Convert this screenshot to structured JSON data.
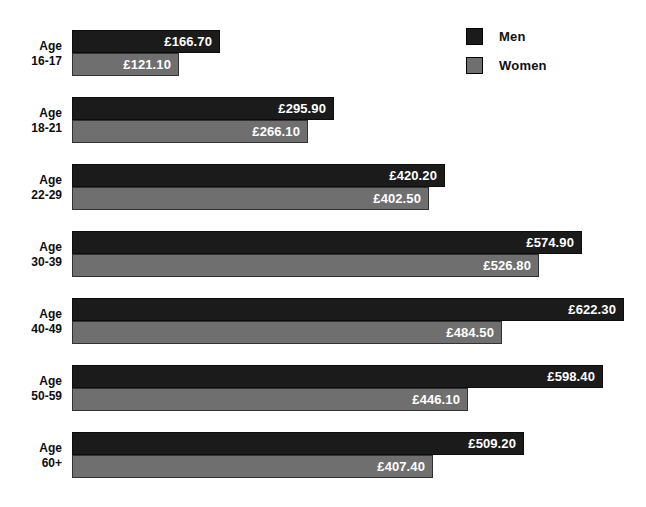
{
  "chart_data": {
    "type": "bar",
    "orientation": "horizontal",
    "title": "",
    "subtitle": "",
    "xlabel": "",
    "ylabel": "",
    "grid": false,
    "legend_position": "top-right",
    "value_prefix": "£",
    "categories": [
      "Age 16-17",
      "Age 18-21",
      "Age 22-29",
      "Age 30-39",
      "Age 40-49",
      "Age 50-59",
      "Age 60+"
    ],
    "category_lines": [
      [
        "Age",
        "16-17"
      ],
      [
        "Age",
        "18-21"
      ],
      [
        "Age",
        "22-29"
      ],
      [
        "Age",
        "30-39"
      ],
      [
        "Age",
        "40-49"
      ],
      [
        "Age",
        "50-59"
      ],
      [
        "Age",
        "60+"
      ]
    ],
    "series": [
      {
        "name": "Men",
        "color": "#1b1b1b",
        "values": [
          166.7,
          295.9,
          420.2,
          574.9,
          622.3,
          598.4,
          509.2
        ],
        "labels": [
          "£166.70",
          "£295.90",
          "£420.20",
          "£574.90",
          "£622.30",
          "£598.40",
          "£509.20"
        ]
      },
      {
        "name": "Women",
        "color": "#6f6f6f",
        "values": [
          121.1,
          266.1,
          402.5,
          526.8,
          484.5,
          446.1,
          407.4
        ],
        "labels": [
          "£121.10",
          "£266.10",
          "£402.50",
          "£526.80",
          "£484.50",
          "£446.10",
          "£407.40"
        ]
      }
    ],
    "xlim": [
      0,
      622.3
    ],
    "px_per_unit": 0.887
  },
  "legend": {
    "items": [
      {
        "label": "Men",
        "color": "#1b1b1b"
      },
      {
        "label": "Women",
        "color": "#6f6f6f"
      }
    ]
  }
}
